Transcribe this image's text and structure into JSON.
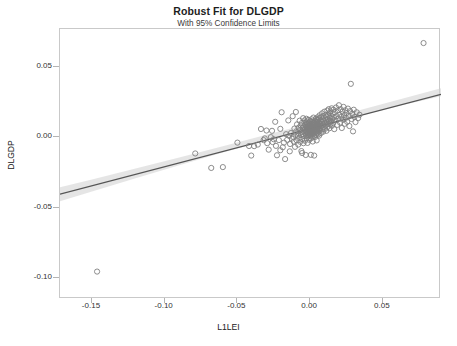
{
  "chart_data": {
    "type": "scatter",
    "title": "Robust Fit for DLGDP",
    "subtitle": "With 95% Confidence Limits",
    "xlabel": "L1LEI",
    "ylabel": "DLGDP",
    "xlim": [
      -0.172,
      0.09
    ],
    "ylim": [
      -0.115,
      0.077
    ],
    "xticks": [
      -0.15,
      -0.1,
      -0.05,
      0.0,
      0.05
    ],
    "xticklabels": [
      "-0.15",
      "-0.10",
      "-0.05",
      "0.00",
      "0.05"
    ],
    "yticks": [
      0.05,
      0.0,
      -0.05,
      -0.1
    ],
    "yticklabels": [
      "0.05",
      "0.00",
      "-0.05",
      "-0.10"
    ],
    "grid": false,
    "legend": null,
    "marker": {
      "shape": "open-circle",
      "radius": 2.6,
      "stroke": "#808080",
      "stroke_width": 0.9,
      "fill": "none"
    },
    "fit_line": {
      "label": "Robust fit",
      "color": "#555555",
      "width": 1.3,
      "x": [
        -0.172,
        0.09
      ],
      "y": [
        -0.0405,
        0.0305
      ],
      "slope": 0.271,
      "intercept": 0.0061
    },
    "confidence_band": {
      "label": "95% Confidence Limits",
      "level": 0.95,
      "fill": "#d0d0d0",
      "opacity": 0.55,
      "x": [
        -0.172,
        -0.15,
        -0.12,
        -0.09,
        -0.06,
        -0.03,
        0.0,
        0.03,
        0.06,
        0.09
      ],
      "upper": [
        -0.0355,
        -0.03,
        -0.0222,
        -0.0143,
        -0.0063,
        0.0018,
        0.0098,
        0.0181,
        0.0266,
        0.0348
      ],
      "lower": [
        -0.0455,
        -0.0386,
        -0.0292,
        -0.0199,
        -0.0109,
        -0.0022,
        0.0063,
        0.0143,
        0.022,
        0.0292
      ]
    },
    "points": [
      [
        -0.1465,
        -0.0955
      ],
      [
        -0.079,
        -0.0115
      ],
      [
        -0.068,
        -0.0218
      ],
      [
        -0.06,
        -0.0212
      ],
      [
        -0.05,
        -0.0038
      ],
      [
        -0.042,
        -0.0062
      ],
      [
        -0.0405,
        -0.013
      ],
      [
        -0.0385,
        -0.0063
      ],
      [
        -0.036,
        -0.0052
      ],
      [
        -0.0338,
        0.0059
      ],
      [
        -0.032,
        -0.002
      ],
      [
        -0.0312,
        -0.0008
      ],
      [
        -0.03,
        0.0048
      ],
      [
        -0.0295,
        -0.0042
      ],
      [
        -0.0285,
        -0.0088
      ],
      [
        -0.027,
        0.0001
      ],
      [
        -0.0258,
        -0.0034
      ],
      [
        -0.025,
        -0.0014
      ],
      [
        -0.024,
        0.011
      ],
      [
        -0.0235,
        -0.0061
      ],
      [
        -0.0228,
        -0.0128
      ],
      [
        -0.0215,
        -0.002
      ],
      [
        -0.0205,
        -0.0092
      ],
      [
        -0.0196,
        0.0178
      ],
      [
        -0.0188,
        -0.0071
      ],
      [
        -0.018,
        -0.0038
      ],
      [
        -0.0172,
        -0.0155
      ],
      [
        -0.0165,
        0.0022
      ],
      [
        -0.0158,
        -0.0018
      ],
      [
        -0.015,
        0.012
      ],
      [
        -0.0144,
        0.001
      ],
      [
        -0.0138,
        -0.0048
      ],
      [
        -0.0132,
        0.003
      ],
      [
        -0.0126,
        -0.001
      ],
      [
        -0.012,
        0.015
      ],
      [
        -0.0116,
        0.0002
      ],
      [
        -0.0112,
        -0.003
      ],
      [
        -0.0108,
        0.0062
      ],
      [
        -0.0104,
        -0.0068
      ],
      [
        -0.01,
        0.0018
      ],
      [
        -0.0098,
        0.018
      ],
      [
        -0.0095,
        0.0042
      ],
      [
        -0.0092,
        -0.0022
      ],
      [
        -0.009,
        0.0092
      ],
      [
        -0.0086,
        0.0012
      ],
      [
        -0.0082,
        -0.0052
      ],
      [
        -0.008,
        0.0068
      ],
      [
        -0.0078,
        0.0026
      ],
      [
        -0.0075,
        -0.0006
      ],
      [
        -0.0072,
        0.0118
      ],
      [
        -0.007,
        0.005
      ],
      [
        -0.0068,
        -0.0032
      ],
      [
        -0.0065,
        0.0084
      ],
      [
        -0.0063,
        0.0016
      ],
      [
        -0.006,
        -0.0098
      ],
      [
        -0.0058,
        0.0038
      ],
      [
        -0.0056,
        0.0102
      ],
      [
        -0.0054,
        -0.0014
      ],
      [
        -0.0052,
        0.0066
      ],
      [
        -0.005,
        0.0022
      ],
      [
        -0.0048,
        0.0136
      ],
      [
        -0.0046,
        -0.0042
      ],
      [
        -0.0044,
        0.0078
      ],
      [
        -0.0042,
        0.0008
      ],
      [
        -0.004,
        0.0052
      ],
      [
        -0.0038,
        0.012
      ],
      [
        -0.0036,
        -0.0024
      ],
      [
        -0.0034,
        0.009
      ],
      [
        -0.0033,
        0.003
      ],
      [
        -0.0032,
        0.0062
      ],
      [
        -0.003,
        -0.0126
      ],
      [
        -0.0029,
        0.0104
      ],
      [
        -0.0028,
        0.0014
      ],
      [
        -0.0027,
        0.0046
      ],
      [
        -0.0026,
        0.0132
      ],
      [
        -0.0025,
        0.0074
      ],
      [
        -0.0024,
        -0.0006
      ],
      [
        -0.0023,
        0.0038
      ],
      [
        -0.0022,
        0.0096
      ],
      [
        -0.0021,
        0.002
      ],
      [
        -0.002,
        0.0058
      ],
      [
        -0.0019,
        0.0112
      ],
      [
        -0.0018,
        -0.004
      ],
      [
        -0.0017,
        0.007
      ],
      [
        -0.0016,
        0.003
      ],
      [
        -0.0015,
        0.0086
      ],
      [
        -0.0014,
        0.0006
      ],
      [
        -0.0013,
        0.005
      ],
      [
        -0.0012,
        0.0124
      ],
      [
        -0.0011,
        0.0064
      ],
      [
        -0.001,
        0.0016
      ],
      [
        -0.0009,
        0.0098
      ],
      [
        -0.0008,
        0.0042
      ],
      [
        -0.0007,
        0.0078
      ],
      [
        -0.0006,
        -0.0018
      ],
      [
        -0.0005,
        0.0056
      ],
      [
        -0.0004,
        0.0108
      ],
      [
        -0.0003,
        0.0024
      ],
      [
        -0.0002,
        0.0068
      ],
      [
        -0.0001,
        0.0036
      ],
      [
        0.0,
        0.009
      ],
      [
        0.0001,
        0.0012
      ],
      [
        0.0002,
        0.006
      ],
      [
        0.0003,
        0.0116
      ],
      [
        0.0004,
        0.0046
      ],
      [
        0.0005,
        -0.0008
      ],
      [
        0.0006,
        0.0082
      ],
      [
        0.0007,
        0.0032
      ],
      [
        0.0008,
        0.0072
      ],
      [
        0.0009,
        0.0128
      ],
      [
        0.001,
        0.0054
      ],
      [
        0.0011,
        0.0004
      ],
      [
        0.0012,
        0.0094
      ],
      [
        0.0013,
        0.004
      ],
      [
        0.0014,
        0.0066
      ],
      [
        0.0015,
        0.011
      ],
      [
        0.0016,
        0.002
      ],
      [
        0.0017,
        0.0076
      ],
      [
        0.0018,
        -0.003
      ],
      [
        0.0019,
        0.005
      ],
      [
        0.002,
        0.01
      ],
      [
        0.0021,
        0.003
      ],
      [
        0.0022,
        0.0062
      ],
      [
        0.0023,
        0.014
      ],
      [
        0.0024,
        0.0084
      ],
      [
        0.0025,
        0.001
      ],
      [
        0.0026,
        0.0048
      ],
      [
        0.0027,
        0.0104
      ],
      [
        0.0028,
        -0.013
      ],
      [
        0.0029,
        0.007
      ],
      [
        0.003,
        0.0026
      ],
      [
        0.0031,
        0.0092
      ],
      [
        0.0032,
        0.0056
      ],
      [
        0.0033,
        0.0118
      ],
      [
        0.0034,
        0.0002
      ],
      [
        0.0035,
        0.0078
      ],
      [
        0.0036,
        0.0036
      ],
      [
        0.0037,
        0.0096
      ],
      [
        0.0038,
        0.0064
      ],
      [
        0.0039,
        0.0132
      ],
      [
        0.004,
        0.0016
      ],
      [
        0.0041,
        0.0086
      ],
      [
        0.0042,
        0.0044
      ],
      [
        0.0043,
        0.0108
      ],
      [
        0.0044,
        0.0072
      ],
      [
        0.0045,
        -0.0022
      ],
      [
        0.0046,
        0.0124
      ],
      [
        0.0047,
        0.0058
      ],
      [
        0.0048,
        0.0098
      ],
      [
        0.0049,
        0.003
      ],
      [
        0.005,
        0.008
      ],
      [
        0.0051,
        0.0142
      ],
      [
        0.0052,
        0.005
      ],
      [
        0.0053,
        0.0112
      ],
      [
        0.0054,
        0.0068
      ],
      [
        0.0055,
        0.002
      ],
      [
        0.0056,
        0.009
      ],
      [
        0.0057,
        0.0128
      ],
      [
        0.0058,
        0.004
      ],
      [
        0.0059,
        0.0076
      ],
      [
        0.006,
        0.0104
      ],
      [
        0.0061,
        0.006
      ],
      [
        0.0062,
        0.0012
      ],
      [
        0.0063,
        0.0136
      ],
      [
        0.0064,
        0.0084
      ],
      [
        0.0065,
        0.0156
      ],
      [
        0.0066,
        0.0048
      ],
      [
        0.0068,
        0.0096
      ],
      [
        0.007,
        0.0118
      ],
      [
        0.0072,
        0.0064
      ],
      [
        0.0074,
        0.003
      ],
      [
        0.0076,
        0.0144
      ],
      [
        0.0078,
        0.008
      ],
      [
        0.008,
        0.0108
      ],
      [
        0.0082,
        0.017
      ],
      [
        0.0084,
        0.0056
      ],
      [
        0.0086,
        0.0126
      ],
      [
        0.0088,
        0.009
      ],
      [
        0.009,
        0.004
      ],
      [
        0.0092,
        0.015
      ],
      [
        0.0094,
        0.0072
      ],
      [
        0.0096,
        0.0112
      ],
      [
        0.0098,
        0.0182
      ],
      [
        0.01,
        0.0098
      ],
      [
        0.0102,
        0.006
      ],
      [
        0.0104,
        0.0134
      ],
      [
        0.0106,
        0.016
      ],
      [
        0.0108,
        0.0086
      ],
      [
        0.011,
        0.0118
      ],
      [
        0.0112,
        0.0046
      ],
      [
        0.0114,
        0.0146
      ],
      [
        0.0116,
        0.0104
      ],
      [
        0.0118,
        0.019
      ],
      [
        0.012,
        0.0074
      ],
      [
        0.0122,
        0.0128
      ],
      [
        0.0124,
        0.0158
      ],
      [
        0.0126,
        0.0096
      ],
      [
        0.0128,
        0.02
      ],
      [
        0.013,
        0.0116
      ],
      [
        0.0132,
        0.0064
      ],
      [
        0.0134,
        0.0172
      ],
      [
        0.0136,
        0.0138
      ],
      [
        0.0138,
        0.009
      ],
      [
        0.014,
        0.0184
      ],
      [
        0.0142,
        0.011
      ],
      [
        0.0145,
        0.0152
      ],
      [
        0.0148,
        0.0206
      ],
      [
        0.015,
        0.0082
      ],
      [
        0.0152,
        0.013
      ],
      [
        0.0155,
        0.0168
      ],
      [
        0.0158,
        0.01
      ],
      [
        0.016,
        0.0196
      ],
      [
        0.0163,
        0.0142
      ],
      [
        0.0166,
        0.0058
      ],
      [
        0.017,
        0.0178
      ],
      [
        0.0174,
        0.012
      ],
      [
        0.0178,
        0.0212
      ],
      [
        0.0182,
        0.015
      ],
      [
        0.0186,
        0.0088
      ],
      [
        0.019,
        0.019
      ],
      [
        0.0194,
        0.0134
      ],
      [
        0.0198,
        0.0228
      ],
      [
        0.0202,
        0.016
      ],
      [
        0.0206,
        0.0104
      ],
      [
        0.021,
        0.02
      ],
      [
        0.0214,
        0.0146
      ],
      [
        0.0218,
        0.0066
      ],
      [
        0.0222,
        0.0182
      ],
      [
        0.0226,
        0.0124
      ],
      [
        0.023,
        0.0216
      ],
      [
        0.0234,
        0.0158
      ],
      [
        0.0238,
        0.0096
      ],
      [
        0.0242,
        0.0192
      ],
      [
        0.0246,
        0.0138
      ],
      [
        0.025,
        0.0172
      ],
      [
        0.0255,
        0.011
      ],
      [
        0.026,
        0.0204
      ],
      [
        0.0265,
        0.0152
      ],
      [
        0.027,
        0.008
      ],
      [
        0.0275,
        0.0186
      ],
      [
        0.028,
        0.038
      ],
      [
        0.0285,
        0.013
      ],
      [
        0.029,
        0.0168
      ],
      [
        0.0295,
        0.0042
      ],
      [
        0.03,
        0.0196
      ],
      [
        0.0305,
        0.0144
      ],
      [
        0.0312,
        0.0108
      ],
      [
        0.032,
        0.0178
      ],
      [
        0.033,
        0.0136
      ],
      [
        0.034,
        0.016
      ],
      [
        -0.0205,
        0.006
      ],
      [
        -0.0262,
        0.0046
      ],
      [
        -0.014,
        -0.01
      ],
      [
        -0.0055,
        -0.0112
      ],
      [
        0.0005,
        -0.0125
      ],
      [
        0.078,
        0.067
      ]
    ]
  }
}
